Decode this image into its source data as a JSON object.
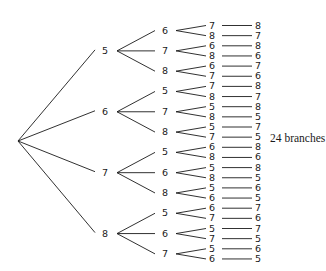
{
  "diagram": {
    "type": "tree",
    "caption": "24 branches",
    "root": "",
    "tree": [
      {
        "label": "5",
        "children": [
          {
            "label": "6",
            "children": [
              {
                "label": "7",
                "leaf": "8"
              },
              {
                "label": "8",
                "leaf": "7"
              }
            ]
          },
          {
            "label": "7",
            "children": [
              {
                "label": "6",
                "leaf": "8"
              },
              {
                "label": "8",
                "leaf": "6"
              }
            ]
          },
          {
            "label": "8",
            "children": [
              {
                "label": "6",
                "leaf": "7"
              },
              {
                "label": "7",
                "leaf": "6"
              }
            ]
          }
        ]
      },
      {
        "label": "6",
        "children": [
          {
            "label": "5",
            "children": [
              {
                "label": "7",
                "leaf": "8"
              },
              {
                "label": "8",
                "leaf": "7"
              }
            ]
          },
          {
            "label": "7",
            "children": [
              {
                "label": "5",
                "leaf": "8"
              },
              {
                "label": "8",
                "leaf": "5"
              }
            ]
          },
          {
            "label": "8",
            "children": [
              {
                "label": "5",
                "leaf": "7"
              },
              {
                "label": "7",
                "leaf": "5"
              }
            ]
          }
        ]
      },
      {
        "label": "7",
        "children": [
          {
            "label": "5",
            "children": [
              {
                "label": "6",
                "leaf": "8"
              },
              {
                "label": "8",
                "leaf": "6"
              }
            ]
          },
          {
            "label": "6",
            "children": [
              {
                "label": "5",
                "leaf": "8"
              },
              {
                "label": "8",
                "leaf": "5"
              }
            ]
          },
          {
            "label": "8",
            "children": [
              {
                "label": "5",
                "leaf": "6"
              },
              {
                "label": "6",
                "leaf": "5"
              }
            ]
          }
        ]
      },
      {
        "label": "8",
        "children": [
          {
            "label": "5",
            "children": [
              {
                "label": "6",
                "leaf": "7"
              },
              {
                "label": "7",
                "leaf": "6"
              }
            ]
          },
          {
            "label": "6",
            "children": [
              {
                "label": "5",
                "leaf": "7"
              },
              {
                "label": "7",
                "leaf": "5"
              }
            ]
          },
          {
            "label": "7",
            "children": [
              {
                "label": "5",
                "leaf": "6"
              },
              {
                "label": "6",
                "leaf": "5"
              }
            ]
          }
        ]
      }
    ]
  },
  "style": {
    "line_color": "#1a1a1a",
    "text_color": "#1a1a1a",
    "background": "#ffffff"
  }
}
